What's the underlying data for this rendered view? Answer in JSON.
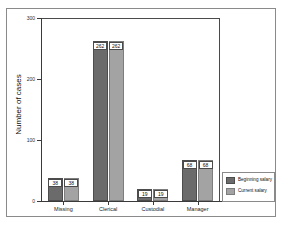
{
  "chart_data": {
    "type": "bar",
    "title": "",
    "xlabel": "",
    "ylabel": "Number of cases",
    "ylim": [
      0,
      300
    ],
    "yticks": [
      0,
      100,
      200,
      300
    ],
    "ytick_labels": [
      "0",
      "100",
      "200",
      "300"
    ],
    "grid": false,
    "legend_position": "bottom-right",
    "categories": [
      "Missing",
      "Clerical",
      "Custodial",
      "Manager"
    ],
    "series": [
      {
        "name": "Beginning salary",
        "color": "#6b6b6b",
        "values": [
          38,
          262,
          19,
          68
        ],
        "labels": [
          "38",
          "262",
          "19",
          "68"
        ]
      },
      {
        "name": "Current salary",
        "color": "#a3a3a3",
        "values": [
          38,
          262,
          19,
          68
        ],
        "labels": [
          "38",
          "262",
          "19",
          "68"
        ]
      }
    ]
  },
  "legend": {
    "items": [
      {
        "label": "Beginning salary",
        "swatch": "s0"
      },
      {
        "label": "Current salary",
        "swatch": "s1"
      }
    ]
  }
}
